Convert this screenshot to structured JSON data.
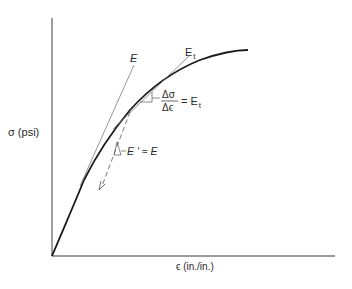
{
  "diagram": {
    "type": "stress-strain curve",
    "y_axis_label": "σ (psi)",
    "x_axis_label": "ϵ (in./in.)",
    "tangent_initial_label": "E",
    "tangent_point_label": "E",
    "tangent_point_subscript": "t",
    "slope_eq_num": "Δσ",
    "slope_eq_den": "Δϵ",
    "slope_eq_rhs": "= E",
    "slope_eq_rhs_sub": "t",
    "unload_label": "E ′ ≈ E",
    "colors": {
      "curve": "#1a1a1a",
      "tangent": "#7a7a7a",
      "axis": "#3a3a3a",
      "text": "#2a2a2a"
    }
  }
}
